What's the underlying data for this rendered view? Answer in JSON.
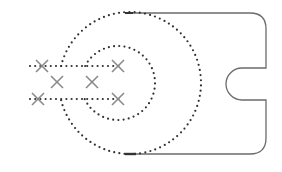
{
  "diagram": {
    "background": "#ffffff",
    "outline_color": "#6b6b6b",
    "dot_color": "#333333",
    "cross_color": "#8a8a8a",
    "outline": {
      "description": "rounded rectangle outline open on the left, with a semicircular notch on the right edge",
      "left_x": 130,
      "top_y": 13,
      "right_x": 266,
      "bottom_y": 154,
      "corner_radius": 16,
      "notch": {
        "top_y": 68,
        "bottom_y": 100,
        "inner_x": 226
      }
    },
    "outer_arc": {
      "cx": 130,
      "cy": 83,
      "r": 71,
      "style": "dotted"
    },
    "inner_arc": {
      "cx": 118,
      "cy": 83,
      "r": 37,
      "style": "dotted"
    },
    "dotted_lines": [
      {
        "x1": 30,
        "y1": 66,
        "x2": 122,
        "y2": 66
      },
      {
        "x1": 30,
        "y1": 99,
        "x2": 122,
        "y2": 99
      }
    ],
    "markers": [
      {
        "type": "cross",
        "x": 42,
        "y": 66
      },
      {
        "type": "cross",
        "x": 38,
        "y": 99
      },
      {
        "type": "cross",
        "x": 57,
        "y": 82
      },
      {
        "type": "cross",
        "x": 92,
        "y": 82
      },
      {
        "type": "cross",
        "x": 118,
        "y": 66
      },
      {
        "type": "cross",
        "x": 118,
        "y": 99
      }
    ]
  }
}
